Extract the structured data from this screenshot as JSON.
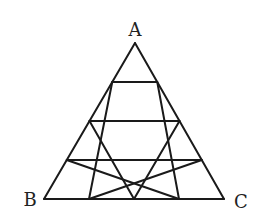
{
  "diagram": {
    "type": "subdivided-equilateral-triangle",
    "subdivisions": 4,
    "stroke_color": "#1a1a1a",
    "stroke_width": 2,
    "vertices": {
      "A": {
        "label": "A",
        "x": 135,
        "y": 43
      },
      "B": {
        "label": "B",
        "x": 44,
        "y": 199
      },
      "C": {
        "label": "C",
        "x": 224,
        "y": 199
      }
    },
    "labels": {
      "A": {
        "text": "A",
        "x": 135,
        "y": 36
      },
      "B": {
        "text": "B",
        "x": 30,
        "y": 206
      },
      "C": {
        "text": "C",
        "x": 241,
        "y": 208
      }
    }
  }
}
